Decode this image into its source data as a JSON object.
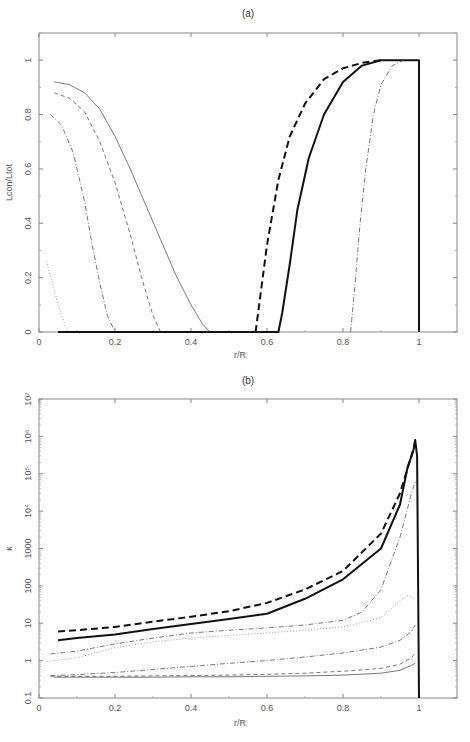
{
  "chart_data": [
    {
      "type": "line",
      "title": "(a)",
      "xlabel": "r/R",
      "ylabel": "Lcon/Ltot",
      "xlim": [
        0,
        1.1
      ],
      "ylim": [
        0,
        1.1
      ],
      "yscale": "linear",
      "grid": false,
      "xticks": [
        "0",
        "0.2",
        "0.4",
        "0.6",
        "0.8",
        "1"
      ],
      "xtick_values": [
        0,
        0.2,
        0.4,
        0.6,
        0.8,
        1
      ],
      "yticks": [
        "0",
        "0.2",
        "0.4",
        "0.6",
        "0.8",
        "1"
      ],
      "ytick_values": [
        0,
        0.2,
        0.4,
        0.6,
        0.8,
        1
      ],
      "series": [
        {
          "name": "thin-solid",
          "style": "solid",
          "weight": "thin",
          "x": [
            0.04,
            0.08,
            0.12,
            0.16,
            0.2,
            0.24,
            0.28,
            0.32,
            0.36,
            0.4,
            0.43,
            0.45,
            0.6
          ],
          "y": [
            0.92,
            0.91,
            0.88,
            0.82,
            0.72,
            0.6,
            0.47,
            0.34,
            0.21,
            0.1,
            0.03,
            0.0,
            0.0
          ]
        },
        {
          "name": "thin-dashed",
          "style": "dashed",
          "weight": "thin",
          "x": [
            0.04,
            0.08,
            0.12,
            0.16,
            0.2,
            0.24,
            0.27,
            0.3,
            0.32
          ],
          "y": [
            0.88,
            0.86,
            0.81,
            0.7,
            0.55,
            0.36,
            0.2,
            0.06,
            0.0
          ]
        },
        {
          "name": "thin-dashdot",
          "style": "dashdot",
          "weight": "thin",
          "x": [
            0.03,
            0.06,
            0.09,
            0.12,
            0.14,
            0.16,
            0.18,
            0.2
          ],
          "y": [
            0.8,
            0.76,
            0.66,
            0.48,
            0.32,
            0.18,
            0.06,
            0.0
          ]
        },
        {
          "name": "thin-dotted",
          "style": "dotted",
          "weight": "thin",
          "x": [
            0.02,
            0.05,
            0.075
          ],
          "y": [
            0.26,
            0.1,
            0.0
          ]
        },
        {
          "name": "thick-solid",
          "style": "solid",
          "weight": "thick",
          "x": [
            0.05,
            0.6,
            0.63,
            0.64,
            0.66,
            0.68,
            0.71,
            0.75,
            0.8,
            0.85,
            0.9,
            0.95,
            1.0,
            1.0
          ],
          "y": [
            0.0,
            0.0,
            0.0,
            0.07,
            0.25,
            0.45,
            0.64,
            0.8,
            0.92,
            0.98,
            1.0,
            1.0,
            1.0,
            0.0
          ]
        },
        {
          "name": "thick-dashed",
          "style": "dashed",
          "weight": "thick",
          "x": [
            0.57,
            0.6,
            0.63,
            0.66,
            0.7,
            0.75,
            0.8,
            0.85,
            0.9
          ],
          "y": [
            0.0,
            0.32,
            0.56,
            0.72,
            0.84,
            0.93,
            0.97,
            0.99,
            1.0
          ]
        },
        {
          "name": "thin-dashdot-outer",
          "style": "dashdot",
          "weight": "thin",
          "x": [
            0.82,
            0.83,
            0.845,
            0.86,
            0.88,
            0.9,
            0.93,
            0.96
          ],
          "y": [
            0.0,
            0.15,
            0.4,
            0.6,
            0.8,
            0.91,
            0.98,
            1.0
          ]
        }
      ]
    },
    {
      "type": "line",
      "title": "(b)",
      "xlabel": "r/R",
      "ylabel": "κ",
      "xlim": [
        0,
        1.1
      ],
      "ylim": [
        0.1,
        10000000
      ],
      "yscale": "log",
      "grid": false,
      "xticks": [
        "0",
        "0.2",
        "0.4",
        "0.6",
        "0.8",
        "1"
      ],
      "xtick_values": [
        0,
        0.2,
        0.4,
        0.6,
        0.8,
        1
      ],
      "yticks": [
        "0.1",
        "1",
        "10",
        "100",
        "1000",
        "10⁴",
        "10⁵",
        "10⁶",
        "10⁷"
      ],
      "ytick_values": [
        0.1,
        1,
        10,
        100,
        1000,
        10000,
        100000,
        1000000,
        10000000
      ],
      "series": [
        {
          "name": "thick-dashed",
          "style": "dashed",
          "weight": "thick",
          "x": [
            0.05,
            0.1,
            0.2,
            0.3,
            0.4,
            0.5,
            0.6,
            0.7,
            0.8,
            0.9,
            0.95,
            0.98,
            0.99
          ],
          "y": [
            6,
            6.5,
            8,
            11,
            15,
            21,
            35,
            80,
            250,
            2500,
            30000,
            300000,
            700000
          ]
        },
        {
          "name": "thick-solid",
          "style": "solid",
          "weight": "thick",
          "x": [
            0.05,
            0.1,
            0.2,
            0.3,
            0.4,
            0.5,
            0.6,
            0.7,
            0.8,
            0.9,
            0.95,
            0.97,
            0.985,
            0.99,
            0.995,
            1.0
          ],
          "y": [
            3.5,
            4,
            5,
            7,
            9.5,
            13,
            18,
            45,
            150,
            1000,
            15000,
            150000,
            400000,
            800000,
            300000,
            0.1
          ]
        },
        {
          "name": "thin-dashdot",
          "style": "dashdot",
          "weight": "thin",
          "x": [
            0.03,
            0.1,
            0.2,
            0.3,
            0.4,
            0.5,
            0.6,
            0.7,
            0.8,
            0.85,
            0.9,
            0.95,
            0.98,
            0.99
          ],
          "y": [
            1.5,
            1.8,
            2.8,
            4,
            5.5,
            6.5,
            7.5,
            9,
            12,
            20,
            80,
            2000,
            30000,
            60000
          ]
        },
        {
          "name": "thin-dotted",
          "style": "dotted",
          "weight": "thin",
          "x": [
            0.02,
            0.1,
            0.2,
            0.3,
            0.4,
            0.5,
            0.6,
            0.7,
            0.8,
            0.9,
            0.95,
            0.97,
            0.99
          ],
          "y": [
            0.95,
            1.2,
            2.2,
            3.2,
            4,
            4.7,
            5.5,
            6.5,
            8,
            14,
            40,
            55,
            45
          ]
        },
        {
          "name": "thin-dashdot-low",
          "style": "dashdot",
          "weight": "thin",
          "x": [
            0.03,
            0.1,
            0.2,
            0.3,
            0.4,
            0.5,
            0.6,
            0.7,
            0.8,
            0.9,
            0.95,
            0.98,
            0.99
          ],
          "y": [
            0.4,
            0.42,
            0.48,
            0.58,
            0.7,
            0.85,
            1.0,
            1.25,
            1.6,
            2.3,
            3.5,
            6,
            9
          ]
        },
        {
          "name": "thin-dashed",
          "style": "dashed",
          "weight": "thin",
          "x": [
            0.03,
            0.1,
            0.2,
            0.3,
            0.4,
            0.5,
            0.6,
            0.7,
            0.8,
            0.9,
            0.95,
            0.98,
            0.99
          ],
          "y": [
            0.38,
            0.38,
            0.38,
            0.39,
            0.4,
            0.41,
            0.43,
            0.46,
            0.52,
            0.62,
            0.8,
            1.2,
            1.6
          ]
        },
        {
          "name": "thin-solid",
          "style": "solid",
          "weight": "thin",
          "x": [
            0.04,
            0.1,
            0.2,
            0.3,
            0.4,
            0.5,
            0.6,
            0.7,
            0.8,
            0.9,
            0.95,
            0.98,
            0.99
          ],
          "y": [
            0.36,
            0.36,
            0.36,
            0.36,
            0.37,
            0.37,
            0.38,
            0.39,
            0.41,
            0.46,
            0.55,
            0.75,
            0.85
          ]
        }
      ]
    }
  ]
}
